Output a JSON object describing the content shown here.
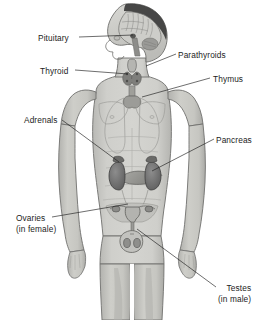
{
  "figure": {
    "background_color": "#ffffff",
    "text_color": "#1c1c1c",
    "body_fill": "#c9c9c5",
    "body_outline": "#6e6e6c",
    "organ_dark": "#6b6b6b"
  },
  "labels": [
    {
      "id": "pituitary",
      "name": "Pituitary",
      "sub": "",
      "side": "left",
      "x": 38,
      "y": 33
    },
    {
      "id": "thyroid",
      "name": "Thyroid",
      "sub": "",
      "side": "left",
      "x": 40,
      "y": 66
    },
    {
      "id": "adrenals",
      "name": "Adrenals",
      "sub": "",
      "side": "left",
      "x": 24,
      "y": 115
    },
    {
      "id": "ovaries",
      "name": "Ovaries",
      "sub": "(in female)",
      "side": "left",
      "x": 16,
      "y": 213
    },
    {
      "id": "parathyroids",
      "name": "Parathyroids",
      "sub": "",
      "side": "right",
      "x": 178,
      "y": 50
    },
    {
      "id": "thymus",
      "name": "Thymus",
      "sub": "",
      "side": "right",
      "x": 213,
      "y": 74
    },
    {
      "id": "pancreas",
      "name": "Pancreas",
      "sub": "",
      "side": "right",
      "x": 216,
      "y": 135
    },
    {
      "id": "testes",
      "name": "Testes",
      "sub": "(in male)",
      "side": "right",
      "x": 218,
      "y": 283
    }
  ],
  "leader_lines": [
    {
      "for": "pituitary",
      "x1": 79,
      "y1": 37,
      "x2": 133,
      "y2": 35
    },
    {
      "for": "thyroid",
      "x1": 75,
      "y1": 70,
      "x2": 128,
      "y2": 74
    },
    {
      "for": "adrenals",
      "x1": 62,
      "y1": 120,
      "x2": 119,
      "y2": 162
    },
    {
      "for": "ovaries",
      "x1": 52,
      "y1": 217,
      "x2": 128,
      "y2": 204
    },
    {
      "for": "parathyroids",
      "x1": 176,
      "y1": 54,
      "x2": 146,
      "y2": 66
    },
    {
      "for": "thymus",
      "x1": 210,
      "y1": 78,
      "x2": 142,
      "y2": 97
    },
    {
      "for": "pancreas",
      "x1": 214,
      "y1": 139,
      "x2": 152,
      "y2": 171
    },
    {
      "for": "testes",
      "x1": 216,
      "y1": 287,
      "x2": 137,
      "y2": 229
    }
  ],
  "organs": [
    {
      "id": "brain",
      "label": "brain-sagittal-section"
    },
    {
      "id": "thyroid-gland",
      "label": "thyroid-gland"
    },
    {
      "id": "trachea",
      "label": "trachea"
    },
    {
      "id": "thymus-gland",
      "label": "thymus-gland"
    },
    {
      "id": "lungs",
      "label": "lung-outlines"
    },
    {
      "id": "kidney-left",
      "label": "kidney-left"
    },
    {
      "id": "kidney-right",
      "label": "kidney-right"
    },
    {
      "id": "pancreas-gland",
      "label": "pancreas-gland"
    },
    {
      "id": "uterus",
      "label": "uterus-and-ovaries"
    },
    {
      "id": "testes-organ",
      "label": "testes-and-scrotum"
    }
  ]
}
